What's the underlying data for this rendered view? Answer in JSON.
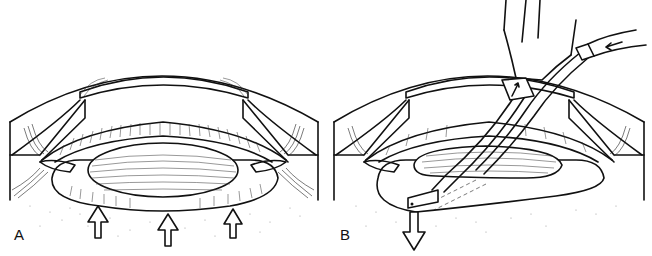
{
  "figure": {
    "panels": [
      {
        "id": "A",
        "label": "A",
        "description": "Anterior segment cross-section with lens in capsular bag; three open arrows pushing upward from below",
        "arrows": {
          "count": 3,
          "direction": "up"
        }
      },
      {
        "id": "B",
        "label": "B",
        "description": "Same cross-section with irrigation/aspiration instrument entering through cornea; arrow on tubing and downward open arrow below capsule",
        "arrows": {
          "count": 3,
          "direction": "mixed"
        }
      }
    ]
  },
  "colors": {
    "line": "#111111",
    "background": "#ffffff",
    "stipple": "#888888"
  }
}
